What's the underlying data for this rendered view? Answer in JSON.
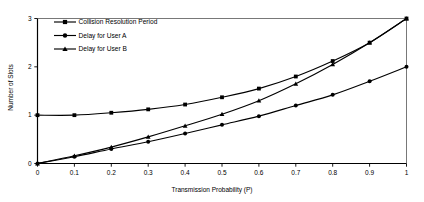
{
  "chart_data": {
    "type": "line",
    "title": "",
    "xlabel": "Transmission Probability (P)",
    "ylabel": "Number of Slots",
    "xlim": [
      0,
      1
    ],
    "ylim": [
      0,
      3
    ],
    "grid": false,
    "legend_position": "top-left-inside",
    "xticks": [
      "0",
      "0.1",
      "0.2",
      "0.3",
      "0.4",
      "0.5",
      "0.6",
      "0.7",
      "0.8",
      "0.9",
      "1"
    ],
    "xtick_values": [
      0,
      0.1,
      0.2,
      0.3,
      0.4,
      0.5,
      0.6,
      0.7,
      0.8,
      0.9,
      1
    ],
    "yticks": [
      "0",
      "1",
      "2",
      "3"
    ],
    "ytick_values": [
      0,
      1,
      2,
      3
    ],
    "x": [
      0,
      0.1,
      0.2,
      0.3,
      0.4,
      0.5,
      0.6,
      0.7,
      0.8,
      0.9,
      1
    ],
    "series": [
      {
        "name": "Collision Resolution Period",
        "marker": "square",
        "color": "#000000",
        "values": [
          1.0,
          1.0,
          1.05,
          1.12,
          1.22,
          1.37,
          1.55,
          1.8,
          2.12,
          2.5,
          3.0
        ]
      },
      {
        "name": "Delay for User A",
        "marker": "circle",
        "color": "#000000",
        "values": [
          0.0,
          0.14,
          0.3,
          0.45,
          0.62,
          0.8,
          0.98,
          1.2,
          1.42,
          1.7,
          2.0
        ]
      },
      {
        "name": "Delay for User B",
        "marker": "triangle",
        "color": "#000000",
        "values": [
          0.0,
          0.16,
          0.34,
          0.55,
          0.78,
          1.02,
          1.3,
          1.65,
          2.05,
          2.5,
          3.0
        ]
      }
    ]
  }
}
